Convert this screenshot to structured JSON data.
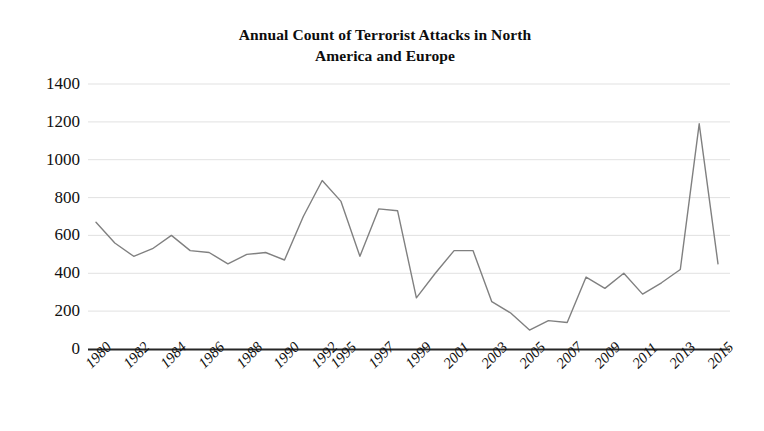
{
  "chart_data": {
    "type": "line",
    "title": "Annual Count of Terrorist Attacks in North America and Europe",
    "title_line1": "Annual Count of Terrorist Attacks in North",
    "title_line2": "America and Europe",
    "xlabel": "",
    "ylabel": "",
    "ylim": [
      0,
      1400
    ],
    "ytick_step": 200,
    "grid": true,
    "legend": "none",
    "line_color": "#808080",
    "axis_color": "#262626",
    "gridline_color": "#d9d9d9",
    "yticks": [
      "1400",
      "1200",
      "1000",
      "800",
      "600",
      "400",
      "200",
      "0"
    ],
    "ytick_values": [
      1400,
      1200,
      1000,
      800,
      600,
      400,
      200,
      0
    ],
    "categories": [
      "1980",
      "1981",
      "1982",
      "1983",
      "1984",
      "1985",
      "1986",
      "1987",
      "1988",
      "1989",
      "1990",
      "1991",
      "1992",
      "1995",
      "1996",
      "1997",
      "1998",
      "1999",
      "2000",
      "2001",
      "2002",
      "2003",
      "2004",
      "2005",
      "2006",
      "2007",
      "2008",
      "2009",
      "2010",
      "2011",
      "2012",
      "2013",
      "2014",
      "2015"
    ],
    "xtick_labels_shown": [
      "1980",
      "1982",
      "1984",
      "1986",
      "1988",
      "1990",
      "1992",
      "1995",
      "1997",
      "1999",
      "2001",
      "2003",
      "2005",
      "2007",
      "2009",
      "2011",
      "2013",
      "2015"
    ],
    "values": [
      670,
      560,
      490,
      530,
      600,
      520,
      510,
      450,
      500,
      510,
      470,
      700,
      890,
      780,
      490,
      740,
      730,
      270,
      400,
      520,
      520,
      250,
      190,
      100,
      150,
      140,
      380,
      320,
      400,
      290,
      350,
      420,
      1190,
      450
    ]
  }
}
